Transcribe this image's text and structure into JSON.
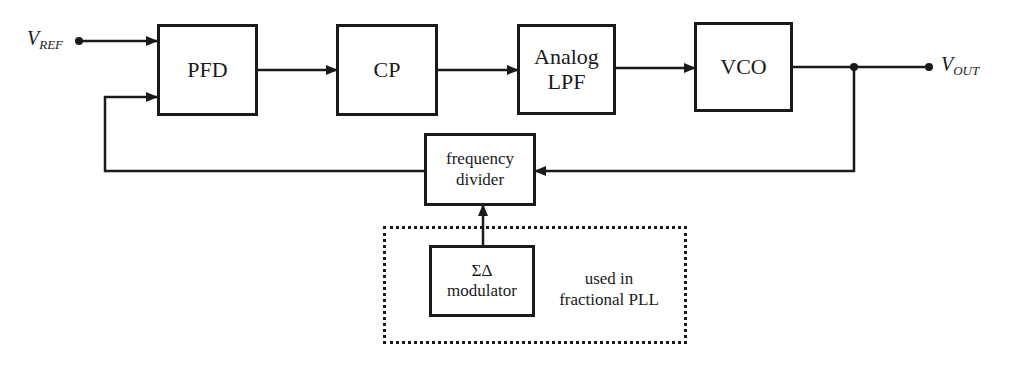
{
  "signals": {
    "input": {
      "main": "V",
      "sub": "REF"
    },
    "output": {
      "main": "V",
      "sub": "OUT"
    }
  },
  "blocks": {
    "pfd": {
      "label": "PFD"
    },
    "cp": {
      "label": "CP"
    },
    "lpf": {
      "line1": "Analog",
      "line2": "LPF"
    },
    "vco": {
      "label": "VCO"
    },
    "divider": {
      "line1": "frequency",
      "line2": "divider"
    },
    "modulator": {
      "line1": "ΣΔ",
      "line2": "modulator"
    }
  },
  "annotation": {
    "line1": "used in",
    "line2": "fractional PLL"
  },
  "colors": {
    "line": "#1a1a1a",
    "background": "#ffffff"
  }
}
